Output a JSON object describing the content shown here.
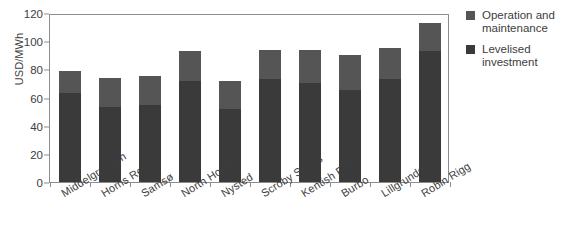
{
  "chart_data": {
    "type": "bar",
    "title": "",
    "subtitle": "",
    "xlabel": "",
    "ylabel": "USD/MWh",
    "ylim": [
      0,
      120
    ],
    "yticks": [
      0,
      20,
      40,
      60,
      80,
      100,
      120
    ],
    "ytick_labels": [
      "0",
      "20",
      "40",
      "60",
      "80",
      "100",
      "120"
    ],
    "grid": false,
    "stacked": true,
    "legend_position": "right",
    "categories": [
      "Middelgrunden",
      "Horns Rev",
      "Samsø",
      "North Hoyle",
      "Nysted",
      "Scroby Sands",
      "Kentish Flat",
      "Burbo",
      "Lillgrunden",
      "Robin Rigg"
    ],
    "series": [
      {
        "name": "Levelised investment",
        "color": "#3a3a3a",
        "values": [
          63,
          53,
          55,
          72,
          52,
          73,
          70,
          65,
          73,
          93
        ]
      },
      {
        "name": "Operation and maintenance",
        "color": "#555555",
        "values": [
          16,
          21,
          20,
          21,
          20,
          21,
          24,
          25,
          22,
          20
        ]
      }
    ],
    "totals": [
      79,
      74,
      75,
      93,
      72,
      94,
      94,
      90,
      95,
      113
    ],
    "legend": [
      {
        "label": "Operation and maintenance",
        "color": "#555555"
      },
      {
        "label": "Levelised investment",
        "color": "#3a3a3a"
      }
    ]
  }
}
